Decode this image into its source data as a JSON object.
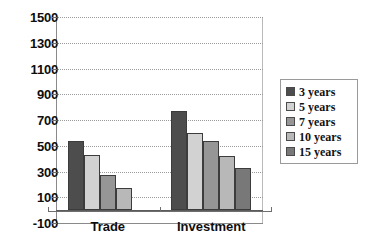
{
  "chart_data": {
    "type": "bar",
    "title": "",
    "xlabel": "",
    "ylabel": "",
    "categories": [
      "Trade",
      "Investment"
    ],
    "ylim": [
      -100,
      1500
    ],
    "yticks": [
      1500,
      1300,
      1100,
      900,
      700,
      500,
      300,
      100,
      -100
    ],
    "ytick_labels": [
      "1500",
      "1300",
      "1100",
      "900",
      "700",
      "500",
      "300",
      "100",
      "-100"
    ],
    "grid": true,
    "legend_position": "right",
    "series": [
      {
        "name": "3 years",
        "color": "#4d4d4d",
        "values": [
          540,
          770
        ]
      },
      {
        "name": "5 years",
        "color": "#d2d2d2",
        "values": [
          430,
          600
        ]
      },
      {
        "name": "7 years",
        "color": "#969696",
        "values": [
          270,
          540
        ]
      },
      {
        "name": "10 years",
        "color": "#b8b8b8",
        "values": [
          170,
          420
        ]
      },
      {
        "name": "15 years",
        "color": "#787878",
        "values": [
          0,
          330
        ]
      }
    ]
  },
  "axes": {
    "y_tick_labels": [
      "1500",
      "1300",
      "1100",
      "900",
      "700",
      "500",
      "300",
      "100",
      "-100"
    ],
    "x_tick_labels": [
      "Trade",
      "Investment"
    ]
  },
  "legend": {
    "items": [
      {
        "label": "3 years",
        "color": "#4d4d4d"
      },
      {
        "label": "5 years",
        "color": "#d2d2d2"
      },
      {
        "label": "7 years",
        "color": "#969696"
      },
      {
        "label": "10 years",
        "color": "#b8b8b8"
      },
      {
        "label": "15 years",
        "color": "#787878"
      }
    ]
  },
  "colors": {
    "series_3_years": "#4d4d4d",
    "series_5_years": "#d2d2d2",
    "series_7_years": "#969696",
    "series_10_years": "#b8b8b8",
    "series_15_years": "#787878",
    "axis": "#6e6e6e",
    "grid": "#9a9a9a",
    "text": "#0d0d0d",
    "background": "#ffffff"
  }
}
